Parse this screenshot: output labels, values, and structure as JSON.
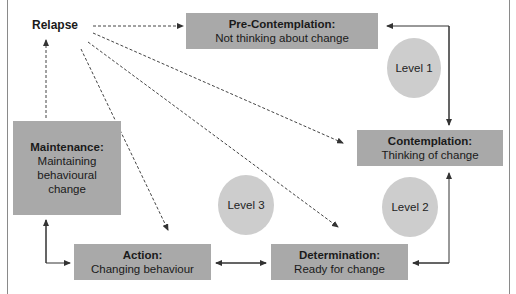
{
  "diagram": {
    "relapse_label": "Relapse",
    "stages": {
      "pre_contemplation": {
        "title": "Pre-Contemplation:",
        "desc": "Not thinking about change"
      },
      "contemplation": {
        "title": "Contemplation:",
        "desc": "Thinking of change"
      },
      "determination": {
        "title": "Determination:",
        "desc": "Ready for change"
      },
      "action": {
        "title": "Action:",
        "desc": "Changing behaviour"
      },
      "maintenance": {
        "title": "Maintenance:",
        "desc_lines": [
          "Maintaining",
          "behavioural",
          "change"
        ]
      }
    },
    "levels": {
      "level1": "Level 1",
      "level2": "Level 2",
      "level3": "Level 3"
    },
    "colors": {
      "box_fill": "#a9a9a9",
      "circle_fill": "#cdcdcd",
      "arrow": "#333333",
      "frame": "#8a8a8a"
    }
  }
}
